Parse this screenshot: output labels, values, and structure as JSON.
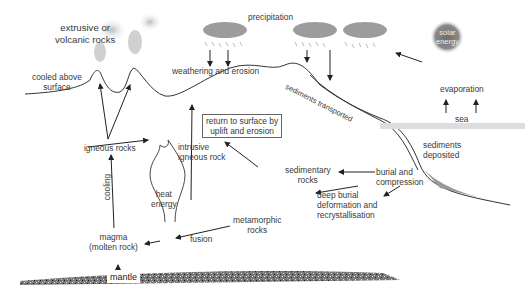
{
  "diagram": {
    "type": "rock cycle",
    "labels": {
      "extrusive": "extrusive or",
      "volcanic": "volcanic rocks",
      "cooled_above": "cooled above",
      "surface": "surface",
      "precipitation": "precipitation",
      "weathering": "weathering and erosion",
      "sediments_transported": "sediments transported",
      "solar1": "solar",
      "solar2": "energy",
      "evaporation": "evaporation",
      "sea": "sea",
      "return1": "return to surface by",
      "return2": "uplift and erosion",
      "igneous_rocks": "igneous rocks",
      "intrusive1": "intrusive",
      "intrusive2": "igneous rock",
      "sediments1": "sediments",
      "sediments2": "deposited",
      "sedimentary1": "sedimentary",
      "sedimentary2": "rocks",
      "burial1": "burial and",
      "burial2": "compression",
      "deep1": "deep burial",
      "deep2": "deformation and",
      "deep3": "recrystallisation",
      "heat1": "heat",
      "heat2": "energy",
      "cooling": "cooling",
      "metamorphic1": "metamorphic",
      "metamorphic2": "rocks",
      "fusion": "fusion",
      "magma1": "magma",
      "magma2": "(molten rock)",
      "mantle": "mantle"
    },
    "colors": {
      "line": "#222222",
      "cloud": "#9a9a9a",
      "sun": "#7a7a7a",
      "mantle": "#555555"
    }
  }
}
